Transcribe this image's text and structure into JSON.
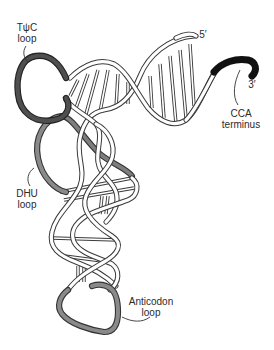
{
  "figure": {
    "labels": {
      "tpsic_loop": {
        "line1": "TψC",
        "line2": "loop"
      },
      "dhu_loop": {
        "line1": "DHU",
        "line2": "loop"
      },
      "anticodon_loop": {
        "line1": "Anticodon",
        "line2": "loop"
      },
      "cca_terminus": {
        "line1": "CCA",
        "line2": "terminus"
      },
      "five_prime": "5′",
      "three_prime": "3′"
    },
    "colors": {
      "backbone_fill": "#ffffff",
      "backbone_outline": "#3a3a3a",
      "tpsic_loop": "#4a4a4a",
      "dhu_loop": "#7a7a7a",
      "anticodon_loop": "#7a7a7a",
      "cca_terminus": "#111111"
    }
  }
}
